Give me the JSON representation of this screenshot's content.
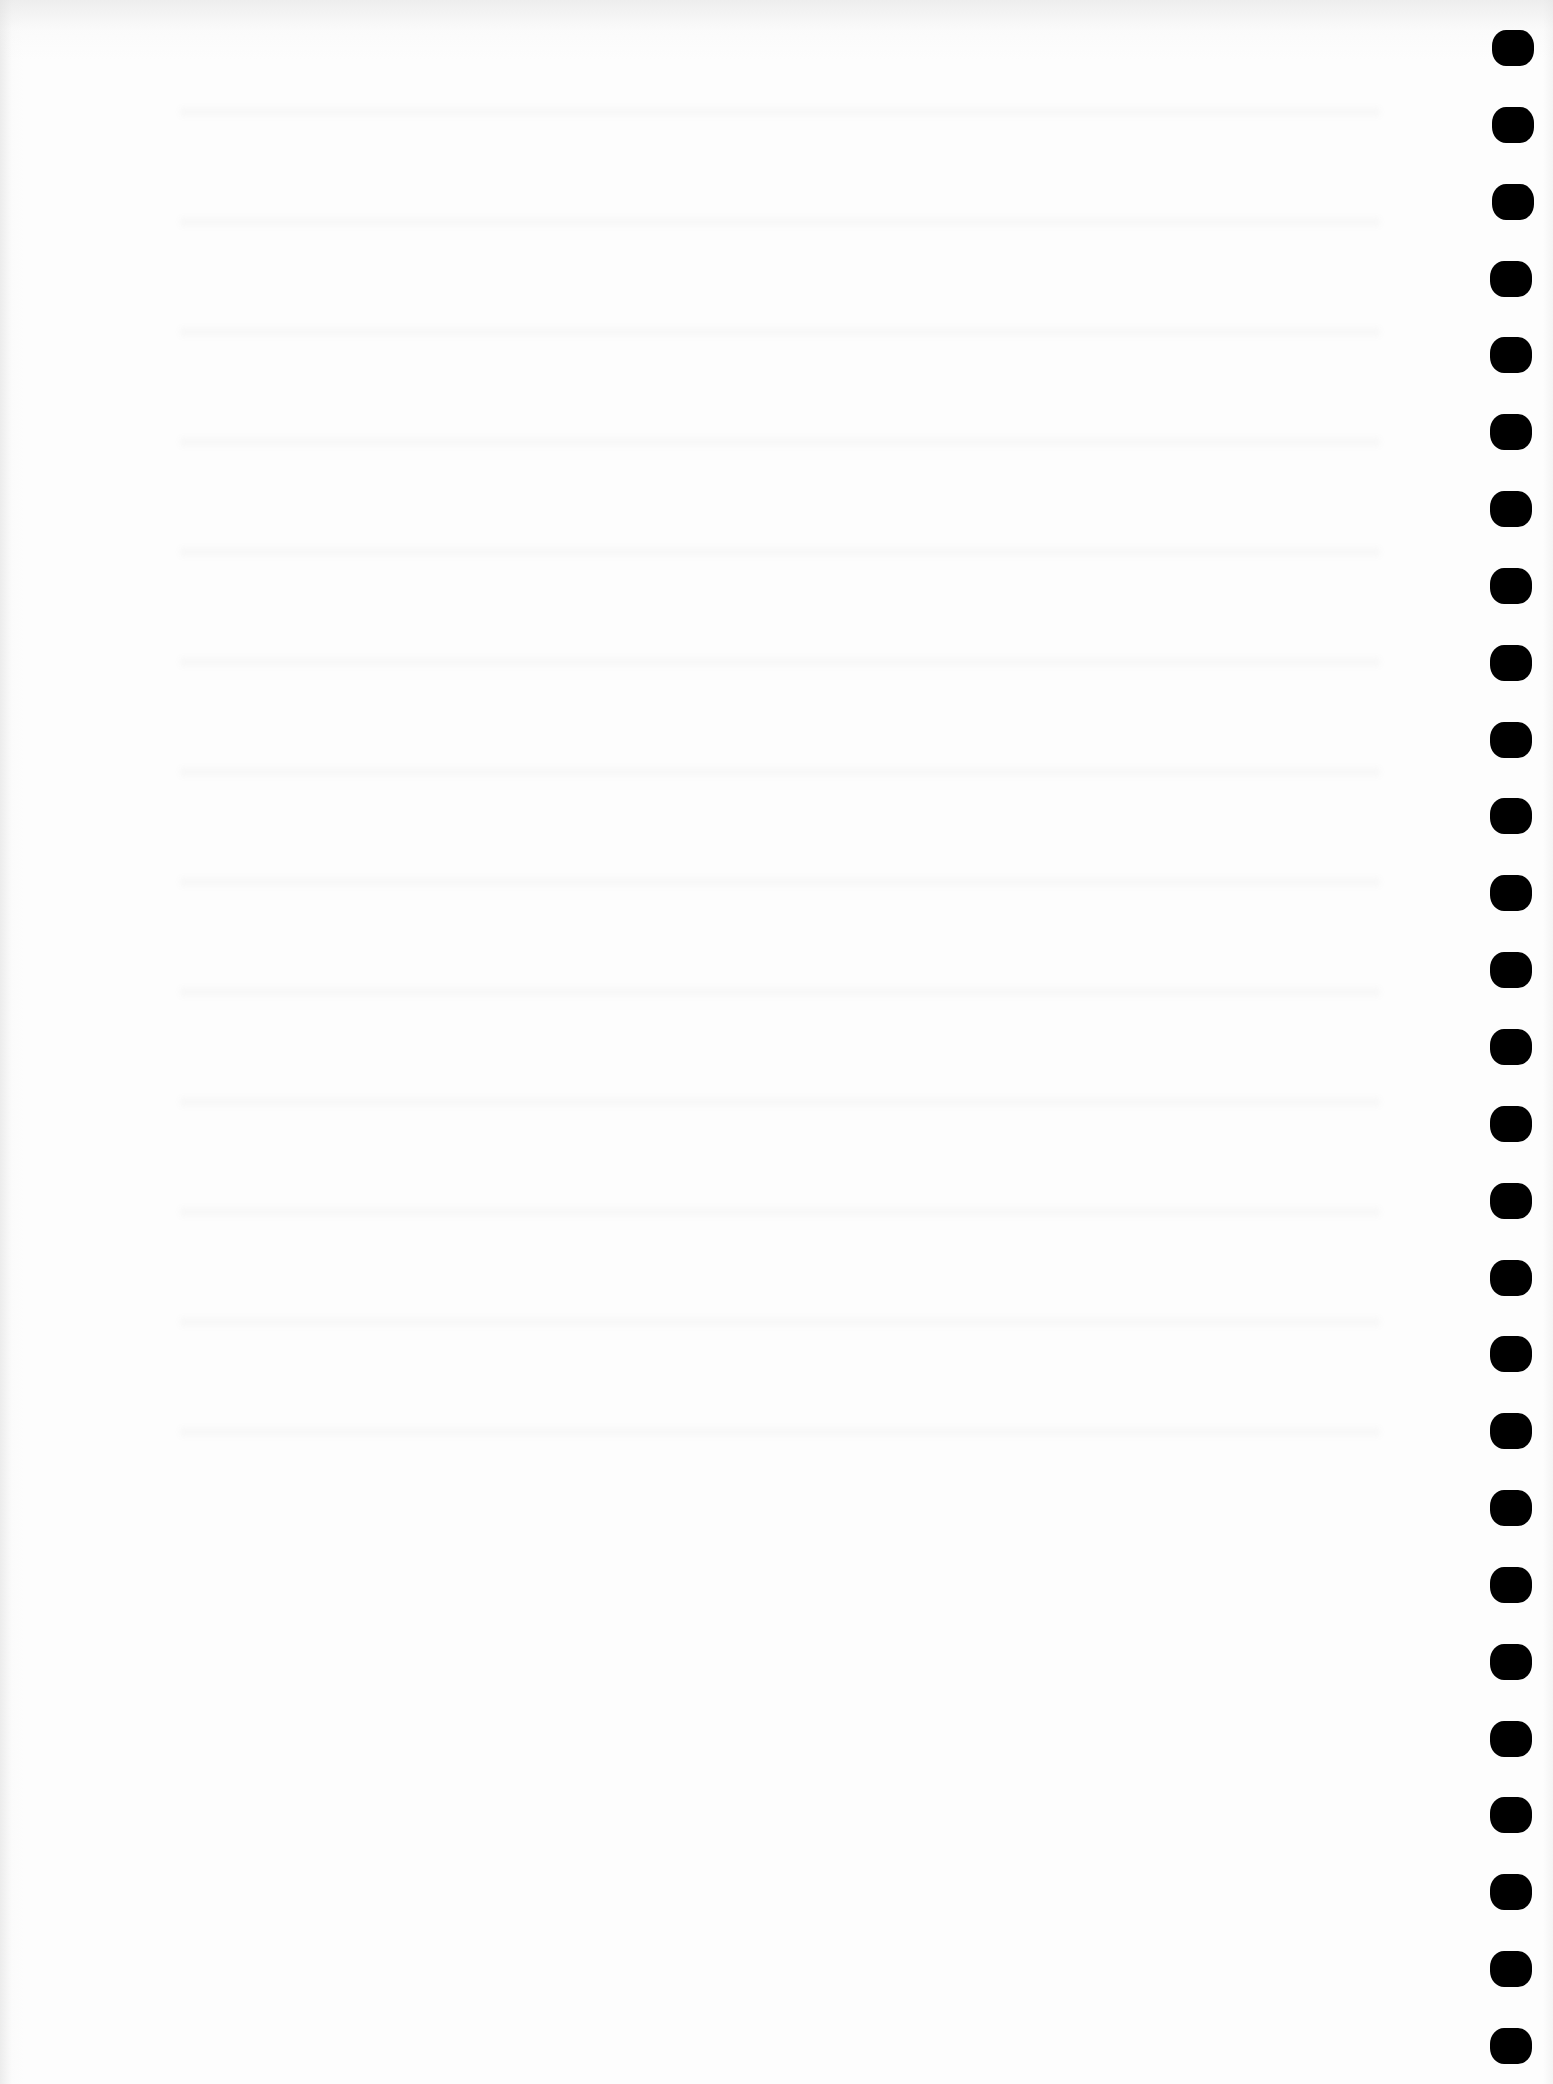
{
  "document": {
    "type": "scanned blank page",
    "text": "",
    "binding": {
      "side": "right",
      "hole_count": 27,
      "hole_color": "#000000",
      "page_color": "#fdfdfd"
    }
  }
}
